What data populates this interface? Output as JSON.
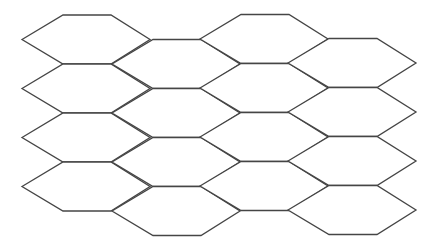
{
  "diagram": {
    "title": "",
    "type": "hexagonal-grid",
    "background": "#ffffff",
    "stroke_color": "#454545",
    "stroke_width": 1.3,
    "columns": 4,
    "rows_per_column": 4,
    "hex": {
      "width": 128,
      "height": 49,
      "top_edge_start": 41,
      "top_edge_end": 89
    },
    "column_origins": [
      {
        "x": 22,
        "y": 15
      },
      {
        "x": 112,
        "y": 39.5
      },
      {
        "x": 200,
        "y": 14.5
      },
      {
        "x": 288,
        "y": 38.5
      }
    ],
    "labels": []
  }
}
